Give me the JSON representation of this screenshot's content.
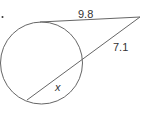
{
  "diagram": {
    "type": "circle-tangent-secant",
    "labels": {
      "tangent": "9.8",
      "secant_external": "7.1",
      "chord": "x"
    },
    "colors": {
      "stroke": "#666666",
      "text": "#333333"
    }
  }
}
